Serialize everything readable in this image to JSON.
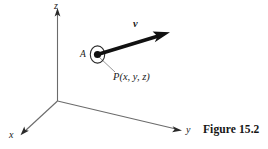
{
  "figure": {
    "caption": "Figure 15.2",
    "axes": {
      "z_label": "z",
      "y_label": "y",
      "x_label": "x"
    },
    "annotations": {
      "node_label": "A",
      "point_label": "P(x, y, z)",
      "vector_label": "v"
    },
    "colors": {
      "axis_line": "#6b6b6b",
      "vector": "#111111",
      "text": "#1a1a1a",
      "caption": "#151515",
      "background": "#ffffff"
    }
  }
}
